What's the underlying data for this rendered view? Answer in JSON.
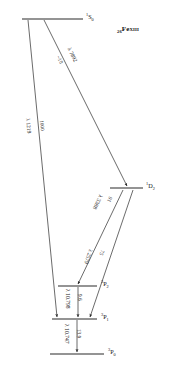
{
  "figure": {
    "type": "grotrian-energy-level-diagram",
    "ion": {
      "atomic_number": "26",
      "element": "Fe",
      "spectrum": "XIII",
      "full": "26Fe XIII"
    }
  },
  "levels": [
    {
      "id": "1S0",
      "term_multiplicity": "1",
      "term_letter": "S",
      "term_j": "0",
      "label": "S",
      "y": 19,
      "x1": 22,
      "x2": 83
    },
    {
      "id": "1D2",
      "term_multiplicity": "1",
      "term_letter": "D",
      "term_j": "2",
      "label": "D",
      "y": 188,
      "x1": 110,
      "x2": 143
    },
    {
      "id": "3P2",
      "term_multiplicity": "3",
      "term_letter": "P",
      "term_j": "2",
      "label": "P",
      "y": 286,
      "x1": 58,
      "x2": 97
    },
    {
      "id": "3P1",
      "term_multiplicity": "3",
      "term_letter": "P",
      "term_j": "1",
      "label": "P",
      "y": 319,
      "x1": 52,
      "x2": 97
    },
    {
      "id": "3P0",
      "term_multiplicity": "3",
      "term_letter": "P",
      "term_j": "0",
      "label": "P",
      "y": 354,
      "x1": 50,
      "x2": 104
    }
  ],
  "transitions": [
    {
      "id": "t-7892",
      "from": "1S0",
      "to": "1D2",
      "wavelength": "λ 7892",
      "intensity": "~10"
    },
    {
      "id": "t-1219",
      "from": "1S0",
      "to": "3P1",
      "wavelength": "λ 1219",
      "intensity": "1000"
    },
    {
      "id": "t-3388",
      "from": "1D2",
      "to": "3P2",
      "wavelength": "λ 3388",
      "intensity": "91"
    },
    {
      "id": "t-2579",
      "from": "1D2",
      "to": "3P1",
      "wavelength": "λ 2579",
      "intensity": "75"
    },
    {
      "id": "t-10798",
      "from": "3P2",
      "to": "3P1",
      "wavelength": "λ 10.798",
      "intensity": "9.6"
    },
    {
      "id": "t-10747",
      "from": "3P1",
      "to": "3P0",
      "wavelength": "λ 10.747",
      "intensity": "13.9"
    }
  ]
}
